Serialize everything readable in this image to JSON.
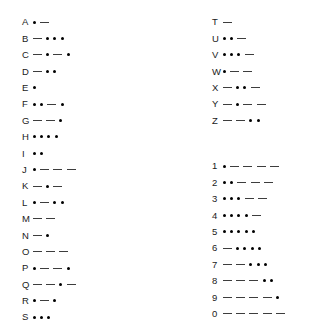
{
  "document": {
    "title": "International Morse Code Chart",
    "background_color": "#ffffff",
    "text_color": "#1a1a1a",
    "dot_color": "#000000",
    "dash_color": "#3d3d3d"
  },
  "chart_data": {
    "type": "table",
    "xlabel": "",
    "ylabel": "",
    "legend": [
      "dot",
      "dash"
    ],
    "columns": [
      {
        "name": "letters-a-to-s",
        "position": "left",
        "rows": [
          {
            "char": "A",
            "code": ".-",
            "symbols": [
              "dot",
              "dash"
            ]
          },
          {
            "char": "B",
            "code": "-...",
            "symbols": [
              "dash",
              "dot",
              "dot",
              "dot"
            ]
          },
          {
            "char": "C",
            "code": "-.-.",
            "symbols": [
              "dash",
              "dot",
              "dash",
              "dot"
            ]
          },
          {
            "char": "D",
            "code": "-..",
            "symbols": [
              "dash",
              "dot",
              "dot"
            ]
          },
          {
            "char": "E",
            "code": ".",
            "symbols": [
              "dot"
            ]
          },
          {
            "char": "F",
            "code": "..-.",
            "symbols": [
              "dot",
              "dot",
              "dash",
              "dot"
            ]
          },
          {
            "char": "G",
            "code": "--.",
            "symbols": [
              "dash",
              "dash",
              "dot"
            ]
          },
          {
            "char": "H",
            "code": "....",
            "symbols": [
              "dot",
              "dot",
              "dot",
              "dot"
            ]
          },
          {
            "char": "I",
            "code": "..",
            "symbols": [
              "dot",
              "dot"
            ]
          },
          {
            "char": "J",
            "code": ".---",
            "symbols": [
              "dot",
              "dash",
              "dash",
              "dash"
            ]
          },
          {
            "char": "K",
            "code": "-.-",
            "symbols": [
              "dash",
              "dot",
              "dash"
            ]
          },
          {
            "char": "L",
            "code": ".-..",
            "symbols": [
              "dot",
              "dash",
              "dot",
              "dot"
            ]
          },
          {
            "char": "M",
            "code": "--",
            "symbols": [
              "dash",
              "dash"
            ]
          },
          {
            "char": "N",
            "code": "-.",
            "symbols": [
              "dash",
              "dot"
            ]
          },
          {
            "char": "O",
            "code": "---",
            "symbols": [
              "dash",
              "dash",
              "dash"
            ]
          },
          {
            "char": "P",
            "code": ".--.",
            "symbols": [
              "dot",
              "dash",
              "dash",
              "dot"
            ]
          },
          {
            "char": "Q",
            "code": "--.-",
            "symbols": [
              "dash",
              "dash",
              "dot",
              "dash"
            ]
          },
          {
            "char": "R",
            "code": ".-.",
            "symbols": [
              "dot",
              "dash",
              "dot"
            ]
          },
          {
            "char": "S",
            "code": "...",
            "symbols": [
              "dot",
              "dot",
              "dot"
            ]
          }
        ]
      },
      {
        "name": "letters-t-to-z",
        "position": "right-top",
        "rows": [
          {
            "char": "T",
            "code": "-",
            "symbols": [
              "dash"
            ]
          },
          {
            "char": "U",
            "code": "..-",
            "symbols": [
              "dot",
              "dot",
              "dash"
            ]
          },
          {
            "char": "V",
            "code": "...-",
            "symbols": [
              "dot",
              "dot",
              "dot",
              "dash"
            ]
          },
          {
            "char": "W",
            "code": ".--",
            "symbols": [
              "dot",
              "dash",
              "dash"
            ]
          },
          {
            "char": "X",
            "code": "-..-",
            "symbols": [
              "dash",
              "dot",
              "dot",
              "dash"
            ]
          },
          {
            "char": "Y",
            "code": "-.--",
            "symbols": [
              "dash",
              "dot",
              "dash",
              "dash"
            ]
          },
          {
            "char": "Z",
            "code": "--..",
            "symbols": [
              "dash",
              "dash",
              "dot",
              "dot"
            ]
          }
        ]
      },
      {
        "name": "digits-one-to-zero",
        "position": "right-bottom",
        "rows": [
          {
            "char": "1",
            "code": ".----",
            "symbols": [
              "dot",
              "dash",
              "dash",
              "dash",
              "dash"
            ]
          },
          {
            "char": "2",
            "code": "..---",
            "symbols": [
              "dot",
              "dot",
              "dash",
              "dash",
              "dash"
            ]
          },
          {
            "char": "3",
            "code": "...--",
            "symbols": [
              "dot",
              "dot",
              "dot",
              "dash",
              "dash"
            ]
          },
          {
            "char": "4",
            "code": "....-",
            "symbols": [
              "dot",
              "dot",
              "dot",
              "dot",
              "dash"
            ]
          },
          {
            "char": "5",
            "code": ".....",
            "symbols": [
              "dot",
              "dot",
              "dot",
              "dot",
              "dot"
            ]
          },
          {
            "char": "6",
            "code": "-....",
            "symbols": [
              "dash",
              "dot",
              "dot",
              "dot",
              "dot"
            ]
          },
          {
            "char": "7",
            "code": "--...",
            "symbols": [
              "dash",
              "dash",
              "dot",
              "dot",
              "dot"
            ]
          },
          {
            "char": "8",
            "code": "---..",
            "symbols": [
              "dash",
              "dash",
              "dash",
              "dot",
              "dot"
            ]
          },
          {
            "char": "9",
            "code": "----.",
            "symbols": [
              "dash",
              "dash",
              "dash",
              "dash",
              "dot"
            ]
          },
          {
            "char": "0",
            "code": "-----",
            "symbols": [
              "dash",
              "dash",
              "dash",
              "dash",
              "dash"
            ]
          }
        ]
      }
    ]
  }
}
